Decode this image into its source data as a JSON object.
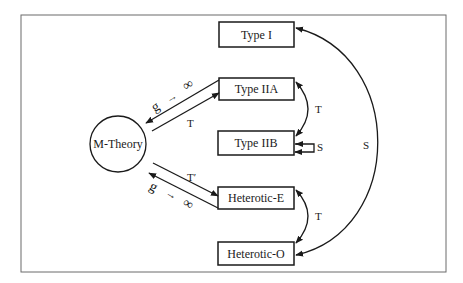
{
  "diagram": {
    "colors": {
      "line": "#1a1a1a",
      "frame": "#6b6b6b",
      "background": "#ffffff"
    },
    "center_node": {
      "id": "m-theory",
      "label": "M-Theory",
      "shape": "circle"
    },
    "nodes": [
      {
        "id": "type-i",
        "label": "Type I"
      },
      {
        "id": "type-iia",
        "label": "Type IIA"
      },
      {
        "id": "type-iib",
        "label": "Type IIB"
      },
      {
        "id": "heterotic-e",
        "label": "Heterotic-E"
      },
      {
        "id": "heterotic-o",
        "label": "Heterotic-O"
      }
    ],
    "edges": [
      {
        "from": "m-theory",
        "to": "type-iia",
        "label": "T"
      },
      {
        "from": "type-iia",
        "to": "m-theory",
        "label_g": "g",
        "label_arrow": "→",
        "label_inf": "∞"
      },
      {
        "from": "m-theory",
        "to": "heterotic-e",
        "label": "T′"
      },
      {
        "from": "heterotic-e",
        "to": "m-theory",
        "label_g": "g",
        "label_arrow": "→",
        "label_inf": "∞"
      },
      {
        "from": "type-iia",
        "to": "type-iib",
        "label": "T",
        "bidirectional": true
      },
      {
        "from": "type-iib",
        "to": "type-iib",
        "label": "S",
        "self_loop": true
      },
      {
        "from": "heterotic-e",
        "to": "heterotic-o",
        "label": "T",
        "bidirectional": true
      },
      {
        "from": "type-i",
        "to": "heterotic-o",
        "label": "S",
        "bidirectional": true
      }
    ]
  }
}
